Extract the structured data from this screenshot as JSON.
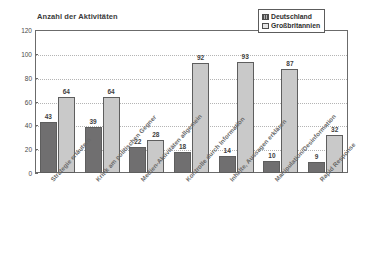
{
  "chart_data": {
    "type": "bar",
    "title": "Anzahl der Aktivitäten",
    "xlabel": "",
    "ylabel": "",
    "ylim": [
      0,
      120
    ],
    "yticks": [
      "0",
      "20",
      "40",
      "60",
      "80",
      "100",
      "120"
    ],
    "grid": true,
    "legend_position": "top-right",
    "categories": [
      "Strategie erläutern",
      "Kritik am politischen Gegner",
      "Medien-Aktivitäten allgemein",
      "Kontrolle durch Information",
      "Inhalte, Aussagen erklären",
      "Manipulation/Desinformation",
      "Rapid Response"
    ],
    "series": [
      {
        "name": "Deutschland",
        "color": "#706f70",
        "values": [
          43,
          39,
          22,
          18,
          14,
          10,
          9
        ]
      },
      {
        "name": "Großbritannien",
        "color": "#c9c9c9",
        "values": [
          64,
          64,
          28,
          92,
          93,
          87,
          32
        ]
      }
    ]
  },
  "legend": {
    "entries": [
      {
        "label": "Deutschland"
      },
      {
        "label": "Großbritannien"
      }
    ]
  }
}
